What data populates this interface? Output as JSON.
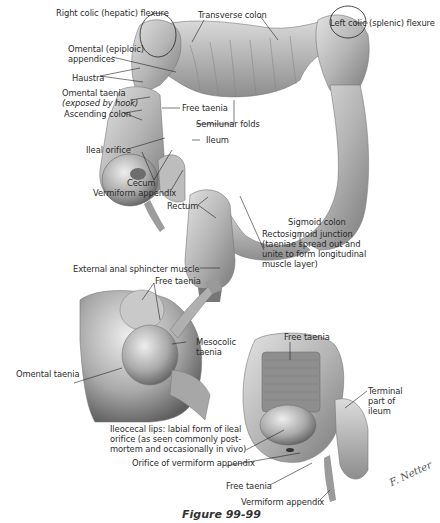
{
  "figure": {
    "caption": "Figure 99-99",
    "signature": "F. Netter"
  },
  "top_illustration": {
    "labels": [
      {
        "id": "right_colic_flexure",
        "text": "Right colic (hepatic) flexure"
      },
      {
        "id": "transverse_colon",
        "text": "Transverse colon"
      },
      {
        "id": "left_colic_flexure",
        "text": "Left colic (splenic) flexure"
      },
      {
        "id": "omental_appendices_1",
        "text": "Omental (epiploic)"
      },
      {
        "id": "omental_appendices_2",
        "text": "appendices"
      },
      {
        "id": "haustra",
        "text": "Haustra"
      },
      {
        "id": "omental_taenia",
        "text": "Omental taenia"
      },
      {
        "id": "exposed_by_hook",
        "text": "(exposed by hook)"
      },
      {
        "id": "free_taenia",
        "text": "Free taenia"
      },
      {
        "id": "ascending_colon",
        "text": "Ascending colon"
      },
      {
        "id": "semilunar_folds",
        "text": "Semilunar folds"
      },
      {
        "id": "ileum",
        "text": "Ileum"
      },
      {
        "id": "ileal_orifice",
        "text": "Ileal orifice"
      },
      {
        "id": "cecum",
        "text": "Cecum"
      },
      {
        "id": "vermiform_appendix",
        "text": "Vermiform appendix"
      },
      {
        "id": "rectum",
        "text": "Rectum"
      },
      {
        "id": "sigmoid_colon",
        "text": "Sigmoid colon"
      },
      {
        "id": "rectosigmoid_junction",
        "text": "Rectosigmoid junction (taeniae spread out and unite to form longitudinal muscle layer)"
      },
      {
        "id": "external_anal_sphincter",
        "text": "External anal sphincter muscle"
      }
    ]
  },
  "bottom_left_illustration": {
    "labels": [
      {
        "id": "free_taenia",
        "text": "Free taenia"
      },
      {
        "id": "mesocolic_taenia",
        "text": "Mesocolic taenia"
      },
      {
        "id": "omental_taenia",
        "text": "Omental taenia"
      }
    ]
  },
  "bottom_right_illustration": {
    "labels": [
      {
        "id": "free_taenia_top",
        "text": "Free taenia"
      },
      {
        "id": "terminal_ileum",
        "text": "Terminal part of ileum"
      },
      {
        "id": "ileocecal_lips",
        "text": "Ileocecal lips: labial form of ileal orifice (as seen commonly post-mortem and occasionally in vivo)"
      },
      {
        "id": "orifice_appendix",
        "text": "Orifice of vermiform appendix"
      },
      {
        "id": "free_taenia_bottom",
        "text": "Free taenia"
      },
      {
        "id": "vermiform_appendix",
        "text": "Vermiform appendix"
      }
    ]
  },
  "colors": {
    "tissue_light": "#d9d9d9",
    "tissue_mid": "#a8a8a8",
    "tissue_dark": "#6f6f6f",
    "leader": "#222222"
  }
}
